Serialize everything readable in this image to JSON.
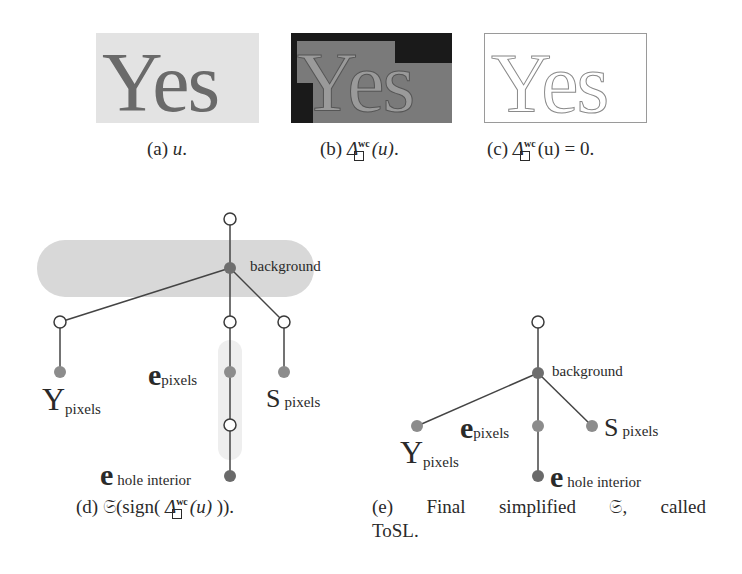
{
  "panels": {
    "a": {
      "image_text": "Yes",
      "caption_prefix": "(a)",
      "caption_math": "u",
      "caption_suffix": "."
    },
    "b": {
      "image_text": "Yes",
      "caption_prefix": "(b)",
      "caption_delta": "Δ",
      "caption_sup": "wc",
      "caption_arg": "(u)",
      "caption_suffix": "."
    },
    "c": {
      "image_text": "Yes",
      "caption_prefix": "(c)",
      "caption_delta": "Δ",
      "caption_sup": "wc",
      "caption_arg": "(u) = 0."
    },
    "d": {
      "caption_prefix": "(d)",
      "caption_frak": "𝔖",
      "caption_mid": "(sign(",
      "caption_delta": "Δ",
      "caption_sup": "wc",
      "caption_arg": "(u)",
      "caption_end": ")).",
      "labels": {
        "background": "background",
        "y_letter": "Y",
        "y_text": "pixels",
        "e_letter": "e",
        "e_text": "pixels",
        "s_letter": "S",
        "s_text": "pixels",
        "hole_letter": "e",
        "hole_text": "hole interior"
      }
    },
    "e": {
      "caption_line1_prefix": "(e)",
      "caption_line1_w1": "Final",
      "caption_line1_w2": "simplified",
      "caption_line1_w3": "𝔖,",
      "caption_line1_w4": "called",
      "caption_line2": "ToSL.",
      "labels": {
        "background": "background",
        "y_letter": "Y",
        "y_text": "pixels",
        "e_letter": "e",
        "e_text": "pixels",
        "s_letter": "S",
        "s_text": "pixels",
        "hole_letter": "e",
        "hole_text": "hole interior"
      }
    }
  },
  "colors": {
    "hollow_node_fill": "#ffffff",
    "node_stroke": "#3a3a3a",
    "background_node": "#6e6e6e",
    "leaf_node": "#8c8c8c",
    "hole_node": "#6a6a6a",
    "blob": "#d6d6d6",
    "edge": "#444444"
  }
}
